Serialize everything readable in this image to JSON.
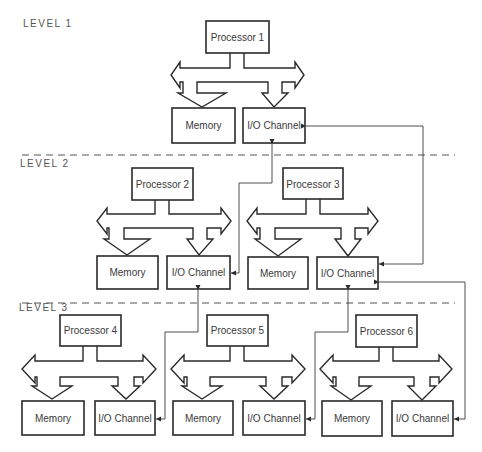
{
  "diagram": {
    "levels": [
      {
        "label": "LEVEL 1"
      },
      {
        "label": "LEVEL 2"
      },
      {
        "label": "LEVEL 3"
      }
    ],
    "processors": [
      {
        "label": "Processor 1",
        "level": 1
      },
      {
        "label": "Processor 2",
        "level": 2
      },
      {
        "label": "Processor 3",
        "level": 2
      },
      {
        "label": "Processor 4",
        "level": 3
      },
      {
        "label": "Processor 5",
        "level": 3
      },
      {
        "label": "Processor 6",
        "level": 3
      }
    ],
    "memory_label": "Memory",
    "io_label": "I/O Channel",
    "connections": [
      {
        "from": "Processor 1 I/O Channel",
        "to": "Processor 2 I/O Channel"
      },
      {
        "from": "Processor 1 I/O Channel",
        "to": "Processor 3 I/O Channel"
      },
      {
        "from": "Processor 2 I/O Channel",
        "to": "Processor 4 I/O Channel"
      },
      {
        "from": "Processor 3 I/O Channel",
        "to": "Processor 5 I/O Channel"
      },
      {
        "from": "Processor 3 I/O Channel",
        "to": "Processor 6 I/O Channel"
      }
    ],
    "colors": {
      "line": "#2a2a2a",
      "text": "#3a3a3a",
      "background": "#ffffff"
    }
  }
}
